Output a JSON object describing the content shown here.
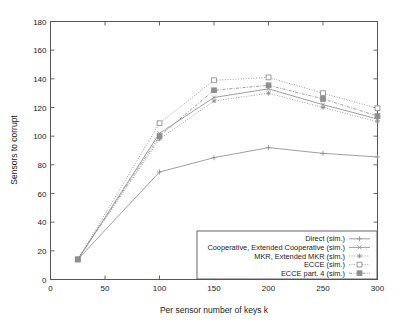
{
  "chart_data": {
    "type": "line",
    "title": "",
    "xlabel": "Per sensor number of keys k",
    "ylabel": "Sensors to corrupt",
    "xlim": [
      0,
      300
    ],
    "ylim": [
      0,
      180
    ],
    "xticks": [
      0,
      50,
      100,
      150,
      200,
      250,
      300
    ],
    "yticks": [
      0,
      20,
      40,
      60,
      80,
      100,
      120,
      140,
      160,
      180
    ],
    "xtick_labels": [
      "0",
      "50",
      "100",
      "150",
      "200",
      "250",
      "300"
    ],
    "ytick_labels": [
      "0",
      "20",
      "40",
      "60",
      "80",
      "100",
      "120",
      "140",
      "160",
      "180"
    ],
    "grid": false,
    "legend_position": "lower right",
    "x": [
      25,
      100,
      150,
      200,
      250,
      300
    ],
    "series": [
      {
        "name": "Direct (sim.)",
        "marker": "plus",
        "linestyle": "solid",
        "values": [
          14,
          75,
          85,
          92,
          88,
          85.5
        ]
      },
      {
        "name": "Cooperative, Extended Cooperative (sim.)",
        "marker": "x",
        "linestyle": "solid",
        "values": [
          14,
          102,
          127,
          133,
          122,
          112
        ]
      },
      {
        "name": "MKR, Extended MKR (sim.)",
        "marker": "star",
        "linestyle": "dotted",
        "values": [
          14,
          98,
          124.5,
          130,
          120,
          110
        ]
      },
      {
        "name": "ECCE (sim.)",
        "marker": "open-square",
        "linestyle": "dotted",
        "values": [
          14,
          109,
          139,
          141,
          130,
          119.5
        ]
      },
      {
        "name": "ECCE part. 4 (sim.)",
        "marker": "filled-square",
        "linestyle": "dashdot",
        "values": [
          14,
          100,
          132,
          135.5,
          126,
          114
        ]
      }
    ],
    "colors": {
      "line": "#8c8c8c",
      "axis": "#555555",
      "text": "#1a1a1a",
      "background": "#ffffff"
    }
  },
  "legend": {
    "entries": [
      "Direct (sim.)",
      "Cooperative, Extended Cooperative (sim.)",
      "MKR, Extended MKR (sim.)",
      "ECCE (sim.)",
      "ECCE part. 4 (sim.)"
    ]
  }
}
